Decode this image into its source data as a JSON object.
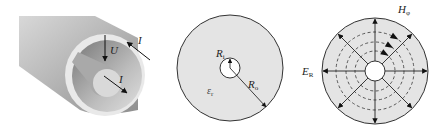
{
  "figure": {
    "panels": [
      {
        "id": "coax-3d",
        "labels": {
          "voltage": "U",
          "current_outer": "I",
          "current_inner": "I"
        }
      },
      {
        "id": "cross-section",
        "labels": {
          "inner_radius": "R",
          "inner_radius_sub": "i",
          "outer_radius": "R",
          "outer_radius_sub": "o",
          "permittivity": "ε",
          "permittivity_sub": "r"
        }
      },
      {
        "id": "field-lines",
        "labels": {
          "magnetic_field": "H",
          "magnetic_field_sub": "φ",
          "electric_field": "E",
          "electric_field_sub": "R"
        }
      }
    ],
    "colors": {
      "dielectric": "#e4e4e4",
      "outline": "#333333",
      "background": "#ffffff"
    }
  }
}
